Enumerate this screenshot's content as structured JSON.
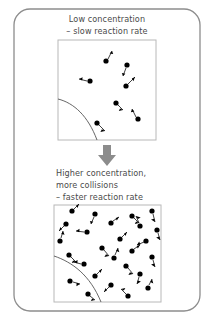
{
  "figure": {
    "title_semantic": "concentration-and-reaction-rate-diagram",
    "background_color": "#ffffff",
    "frame_color": "#8d8d8d",
    "text_color": "#4a4a4a",
    "particle_color": "#000000",
    "curve_color": "#555555",
    "box_border_color": "#b8b8b8",
    "arrow_color": "#8c8c8c"
  },
  "top_caption": {
    "line1": "Low concentration",
    "line2": "– slow reaction rate"
  },
  "bottom_caption": {
    "line1": "Higher concentration,",
    "line2": "more collisions",
    "line3": "– faster reaction rate"
  },
  "transition_arrow": {
    "icon": "down-arrow-icon",
    "direction": "down"
  },
  "panel_low": {
    "label": "low-concentration-panel",
    "box": {
      "x": 58,
      "y": 40,
      "width": 98,
      "height": 100
    },
    "particle_count": 7,
    "surface_curve": "left-edge to bottom-edge concave curve",
    "particles": [
      {
        "cx": 106,
        "cy": 61,
        "vx": 4,
        "vy": -8
      },
      {
        "cx": 127,
        "cy": 65,
        "vx": -3,
        "vy": 8
      },
      {
        "cx": 90,
        "cy": 81,
        "vx": -9,
        "vy": -2
      },
      {
        "cx": 126,
        "cy": 86,
        "vx": 9,
        "vy": -7
      },
      {
        "cx": 138,
        "cy": 119,
        "vx": -6,
        "vy": -9
      },
      {
        "cx": 97,
        "cy": 123,
        "vx": 8,
        "vy": 7
      },
      {
        "cx": 116,
        "cy": 103,
        "vx": 5,
        "vy": 6
      }
    ]
  },
  "panel_high": {
    "label": "high-concentration-panel",
    "box": {
      "x": 54,
      "y": 205,
      "width": 107,
      "height": 97
    },
    "particle_count": 26,
    "surface_curve": "left-edge to bottom-edge concave curve",
    "particles": [
      {
        "cx": 72,
        "cy": 211,
        "vx": 6,
        "vy": -5
      },
      {
        "cx": 95,
        "cy": 214,
        "vx": -5,
        "vy": 7
      },
      {
        "cx": 132,
        "cy": 216,
        "vx": 7,
        "vy": 5
      },
      {
        "cx": 152,
        "cy": 211,
        "vx": 4,
        "vy": 8
      },
      {
        "cx": 66,
        "cy": 224,
        "vx": -7,
        "vy": 5
      },
      {
        "cx": 111,
        "cy": 223,
        "vx": 8,
        "vy": -5
      },
      {
        "cx": 140,
        "cy": 226,
        "vx": -5,
        "vy": -8
      },
      {
        "cx": 157,
        "cy": 230,
        "vx": 4,
        "vy": 7
      },
      {
        "cx": 87,
        "cy": 232,
        "vx": -9,
        "vy": 1
      },
      {
        "cx": 60,
        "cy": 241,
        "vx": 3,
        "vy": -9
      },
      {
        "cx": 120,
        "cy": 239,
        "vx": 7,
        "vy": -6
      },
      {
        "cx": 146,
        "cy": 241,
        "vx": -8,
        "vy": 4
      },
      {
        "cx": 102,
        "cy": 248,
        "vx": 6,
        "vy": 7
      },
      {
        "cx": 132,
        "cy": 251,
        "vx": 8,
        "vy": -4
      },
      {
        "cx": 69,
        "cy": 255,
        "vx": -6,
        "vy": 6
      },
      {
        "cx": 114,
        "cy": 258,
        "vx": 5,
        "vy": -8
      },
      {
        "cx": 152,
        "cy": 257,
        "vx": 3,
        "vy": 8
      },
      {
        "cx": 84,
        "cy": 264,
        "vx": -8,
        "vy": -3
      },
      {
        "cx": 126,
        "cy": 266,
        "vx": 7,
        "vy": 6
      },
      {
        "cx": 95,
        "cy": 276,
        "vx": 8,
        "vy": -4
      },
      {
        "cx": 140,
        "cy": 274,
        "vx": -4,
        "vy": 8
      },
      {
        "cx": 70,
        "cy": 281,
        "vx": 9,
        "vy": 2
      },
      {
        "cx": 111,
        "cy": 285,
        "vx": -6,
        "vy": 7
      },
      {
        "cx": 148,
        "cy": 288,
        "vx": 5,
        "vy": -7
      },
      {
        "cx": 88,
        "cy": 294,
        "vx": 7,
        "vy": 5
      },
      {
        "cx": 128,
        "cy": 296,
        "vx": -7,
        "vy": -5
      }
    ]
  }
}
